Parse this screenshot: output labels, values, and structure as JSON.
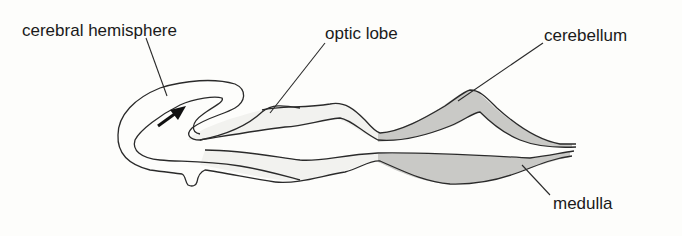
{
  "diagram": {
    "type": "anatomical section",
    "labels": {
      "cerebral_hemisphere": "cerebral hemisphere",
      "optic_lobe": "optic lobe",
      "cerebellum": "cerebellum",
      "medulla": "medulla"
    },
    "colors": {
      "outline": "#2a2a2a",
      "light_fill": "#f2f2ef",
      "shaded_fill": "#c9c9c6",
      "background": "#fdfdfb"
    }
  }
}
